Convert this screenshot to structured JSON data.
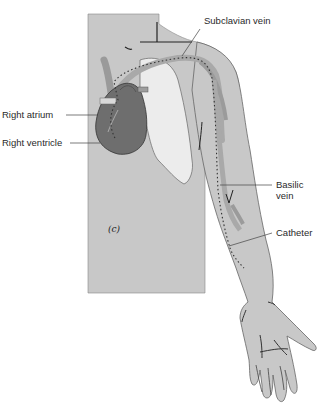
{
  "figure": {
    "panel_mark": "(c)",
    "labels": {
      "subclavian_vein": "Subclavian vein",
      "right_atrium": "Right atrium",
      "right_ventricle": "Right ventricle",
      "basilic_vein_line1": "Basilic",
      "basilic_vein_line2": "vein",
      "catheter": "Catheter"
    },
    "colors": {
      "skin": "#c8c8c8",
      "lung": "#ebebeb",
      "heart": "#6e6e6e",
      "vein": "#a9a9a9",
      "outline": "#4a4a4a",
      "text": "#2a2a2a"
    }
  }
}
